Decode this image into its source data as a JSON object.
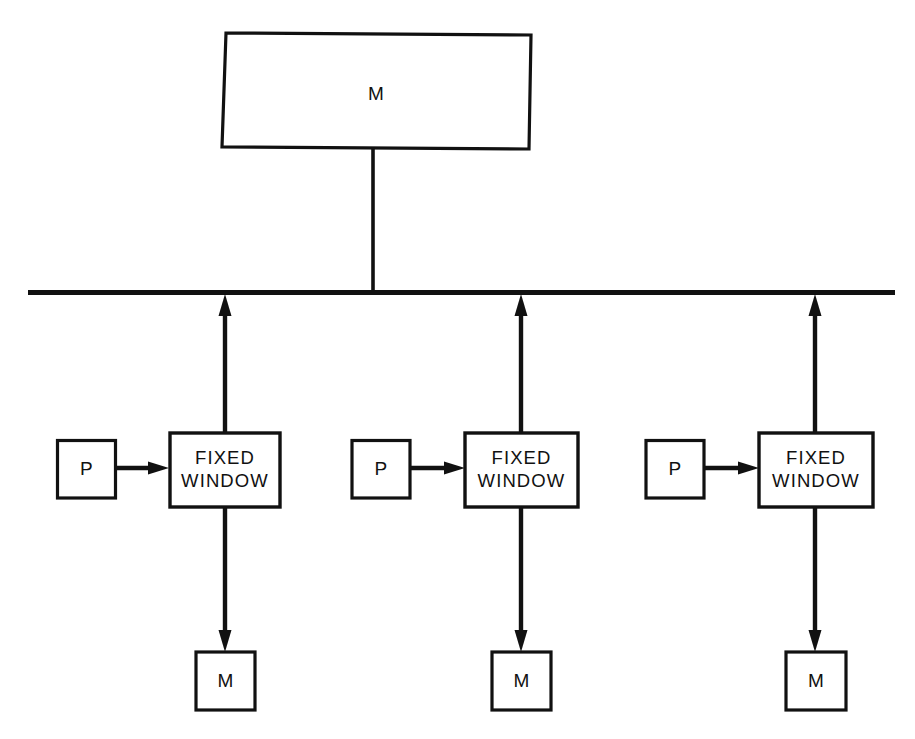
{
  "diagram": {
    "background_color": "#ffffff",
    "line_color": "#111111",
    "top_node": {
      "label": "M",
      "name": "memory-top"
    },
    "bus": {
      "name": "system-bus",
      "label": ""
    },
    "groups": [
      {
        "processor": {
          "label": "P",
          "name": "processor-1"
        },
        "window": {
          "label_line1": "FIXED",
          "label_line2": "WINDOW",
          "name": "fixed-window-1"
        },
        "memory": {
          "label": "M",
          "name": "memory-1"
        }
      },
      {
        "processor": {
          "label": "P",
          "name": "processor-2"
        },
        "window": {
          "label_line1": "FIXED",
          "label_line2": "WINDOW",
          "name": "fixed-window-2"
        },
        "memory": {
          "label": "M",
          "name": "memory-2"
        }
      },
      {
        "processor": {
          "label": "P",
          "name": "processor-3"
        },
        "window": {
          "label_line1": "FIXED",
          "label_line2": "WINDOW",
          "name": "fixed-window-3"
        },
        "memory": {
          "label": "M",
          "name": "memory-3"
        }
      }
    ],
    "connections": [
      {
        "name": "memory-top-to-bus",
        "from": "memory-top",
        "to": "system-bus",
        "arrow": "none"
      },
      {
        "name": "fixed-window-1-to-bus",
        "from": "fixed-window-1",
        "to": "system-bus",
        "arrow": "up"
      },
      {
        "name": "fixed-window-2-to-bus",
        "from": "fixed-window-2",
        "to": "system-bus",
        "arrow": "up"
      },
      {
        "name": "fixed-window-3-to-bus",
        "from": "fixed-window-3",
        "to": "system-bus",
        "arrow": "up"
      },
      {
        "name": "processor-1-to-fixed-window-1",
        "from": "processor-1",
        "to": "fixed-window-1",
        "arrow": "right"
      },
      {
        "name": "processor-2-to-fixed-window-2",
        "from": "processor-2",
        "to": "fixed-window-2",
        "arrow": "right"
      },
      {
        "name": "processor-3-to-fixed-window-3",
        "from": "processor-3",
        "to": "fixed-window-3",
        "arrow": "right"
      },
      {
        "name": "fixed-window-1-to-memory-1",
        "from": "fixed-window-1",
        "to": "memory-1",
        "arrow": "down"
      },
      {
        "name": "fixed-window-2-to-memory-2",
        "from": "fixed-window-2",
        "to": "memory-2",
        "arrow": "down"
      },
      {
        "name": "fixed-window-3-to-memory-3",
        "from": "fixed-window-3",
        "to": "memory-3",
        "arrow": "down"
      }
    ]
  }
}
